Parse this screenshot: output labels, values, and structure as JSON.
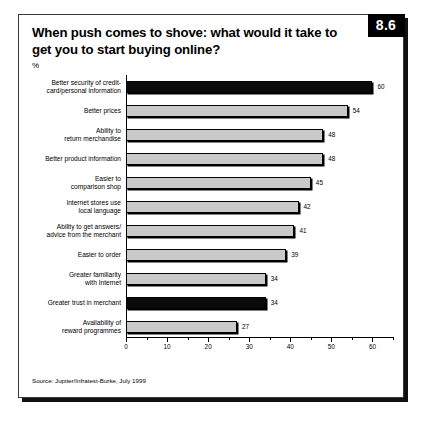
{
  "figure": {
    "badge": "8.6",
    "title": "When push comes to shove: what would it take to get you to start buying online?",
    "unit_label": "%",
    "source": "Source: Jupiter/Infratest-Burke, July 1999"
  },
  "chart_data": {
    "type": "bar",
    "orientation": "horizontal",
    "title": "When push comes to shove: what would it take to get you to start buying online?",
    "xlabel": "",
    "ylabel": "",
    "unit": "%",
    "xlim": [
      0,
      65
    ],
    "grid": false,
    "legend": false,
    "xticks": [
      0,
      10,
      20,
      30,
      40,
      50,
      60
    ],
    "xtick_labels": [
      "0",
      "10",
      "20",
      "30",
      "40",
      "50",
      "60"
    ],
    "minor_tick_step": 5,
    "highlight_color": "#0a0a0a",
    "bar_color": "#c9c9c9",
    "categories": [
      "Better security of credit-\ncard/personal information",
      "Better prices",
      "Ability to\nreturn merchandise",
      "Better product information",
      "Easier to\ncomparison shop",
      "Internet stores use\nlocal language",
      "Ability to get answers/\nadvice from the merchant",
      "Easier to order",
      "Greater familiarity\nwith Internet",
      "Greater trust in merchant",
      "Availability of\nreward programmes"
    ],
    "values": [
      60,
      54,
      48,
      48,
      45,
      42,
      41,
      39,
      34,
      34,
      27
    ],
    "value_labels": [
      "60",
      "54",
      "48",
      "48",
      "45",
      "42",
      "41",
      "39",
      "34",
      "34",
      "27"
    ],
    "highlighted": [
      true,
      false,
      false,
      false,
      false,
      false,
      false,
      false,
      false,
      true,
      false
    ]
  }
}
